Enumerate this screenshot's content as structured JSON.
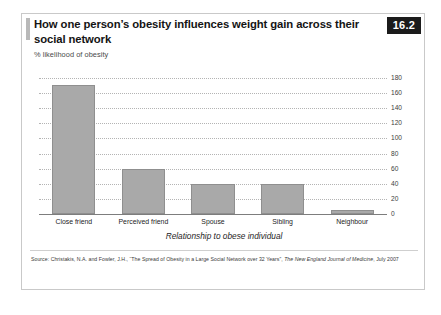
{
  "figure": {
    "badge": "16.2",
    "title": "How one person’s obesity influences weight gain across their social network",
    "subtitle": "% likelihood of obesity",
    "source_prefix": "Source: Christakis, N.A. and Fowler, J.H., “The Spread of Obesity in a Large Social Network over 32 Years”, ",
    "source_italic": "The New England Journal of Medicine",
    "source_suffix": ", July 2007"
  },
  "chart_data": {
    "type": "bar",
    "title": "How one person’s obesity influences weight gain across their social network",
    "subtitle": "% likelihood of obesity",
    "xlabel": "Relationship to obese individual",
    "ylabel": "% likelihood of obesity",
    "ylim": [
      0,
      180
    ],
    "ytick_interval": 20,
    "yticks": [
      0,
      20,
      40,
      60,
      80,
      100,
      120,
      140,
      160,
      180
    ],
    "grid": true,
    "legend": "none",
    "bar_color": "#a9a9a9",
    "categories": [
      "Close friend",
      "Perceived friend",
      "Spouse",
      "Sibling",
      "Neighbour"
    ],
    "values": [
      171,
      60,
      40,
      40,
      5
    ]
  }
}
